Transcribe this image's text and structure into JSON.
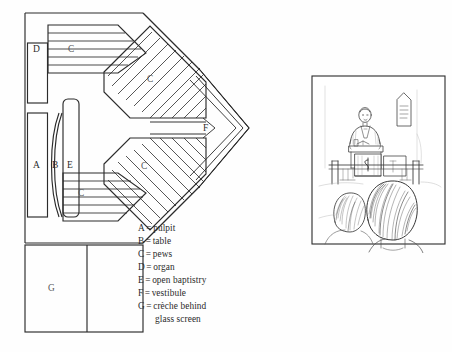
{
  "page": {
    "background_color": "#fefefe",
    "ink_color": "#2b2b2b",
    "label_color": "#555555"
  },
  "floor_plan": {
    "title": "church floor plan",
    "zone_labels": {
      "a": "A",
      "b": "B",
      "c": "C",
      "d": "D",
      "e": "E",
      "f": "F",
      "g": "G"
    },
    "pew_blocks": [
      {
        "id": "c-top",
        "label": "C"
      },
      {
        "id": "c-upper-diagonal",
        "label": "C"
      },
      {
        "id": "c-lower-diagonal",
        "label": "C"
      },
      {
        "id": "c-bottom",
        "label": "C"
      }
    ]
  },
  "legend": {
    "entries": [
      {
        "key": "A",
        "eq": "=",
        "value": "pulpit"
      },
      {
        "key": "B",
        "eq": "=",
        "value": "table"
      },
      {
        "key": "C",
        "eq": "=",
        "value": "pews"
      },
      {
        "key": "D",
        "eq": "=",
        "value": "organ"
      },
      {
        "key": "E",
        "eq": "=",
        "value": "open baptistry"
      },
      {
        "key": "F",
        "eq": "=",
        "value": "vestibule"
      },
      {
        "key": "G",
        "eq": "=",
        "value": "crèche behind"
      }
    ],
    "continuation": "glass screen"
  },
  "illustration": {
    "caption": "",
    "description": "pencil sketch of congregation view toward preacher at pulpit",
    "elements": [
      "preacher-figure",
      "pulpit",
      "communion-table",
      "wall-plaque",
      "front-rail",
      "head-left",
      "head-right"
    ]
  }
}
